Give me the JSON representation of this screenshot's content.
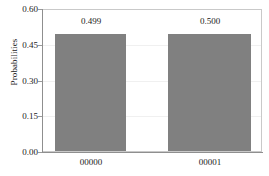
{
  "chart_data": {
    "type": "bar",
    "title": "",
    "subtitle": "",
    "xlabel": "",
    "ylabel": "Probabilities",
    "categories": [
      "00000",
      "00001"
    ],
    "values": [
      0.499,
      0.5
    ],
    "data_labels": [
      "0.499",
      "0.500"
    ],
    "ylim": [
      0.0,
      0.6
    ],
    "yticks": [
      0.0,
      0.15,
      0.3,
      0.45,
      0.6
    ],
    "ytick_labels": [
      "0.00",
      "0.15",
      "0.30",
      "0.45",
      "0.60"
    ],
    "grid": true,
    "grid_axis": "y",
    "legend": false,
    "legend_position": "none",
    "bar_color": "#808080",
    "frame_color": "#c9c9c9",
    "axis_color": "#8f8f8f",
    "gridline_color": "#f0f0f0",
    "text_color": "#1a1a1a",
    "background_color": "#ffffff"
  }
}
